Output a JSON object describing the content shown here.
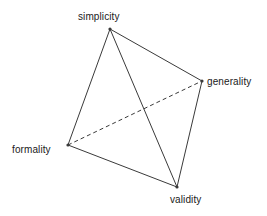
{
  "diagram": {
    "type": "tetrahedron-graph",
    "background_color": "#ffffff",
    "line_color": "#3a3a3a",
    "text_color": "#1a1a1a",
    "width": 267,
    "height": 216,
    "vertices": [
      {
        "id": "simplicity",
        "label": "simplicity",
        "x": 110,
        "y": 29
      },
      {
        "id": "generality",
        "label": "generality",
        "x": 202,
        "y": 81
      },
      {
        "id": "formality",
        "label": "formality",
        "x": 68,
        "y": 145
      },
      {
        "id": "validity",
        "label": "validity",
        "x": 177,
        "y": 187
      }
    ],
    "edges": [
      {
        "from": "simplicity",
        "to": "generality",
        "style": "solid"
      },
      {
        "from": "simplicity",
        "to": "formality",
        "style": "solid"
      },
      {
        "from": "simplicity",
        "to": "validity",
        "style": "solid"
      },
      {
        "from": "generality",
        "to": "validity",
        "style": "solid"
      },
      {
        "from": "formality",
        "to": "validity",
        "style": "solid"
      },
      {
        "from": "formality",
        "to": "generality",
        "style": "dashed"
      }
    ]
  }
}
